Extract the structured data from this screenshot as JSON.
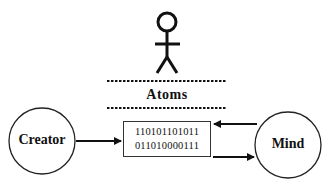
{
  "diagram": {
    "figure": {
      "icon": "stick-figure-icon"
    },
    "divider_label": "Atoms",
    "nodes": {
      "creator": {
        "label": "Creator"
      },
      "mind": {
        "label": "Mind"
      }
    },
    "binary_box": {
      "lines": [
        "110101101011",
        "011010000111"
      ]
    },
    "edges": [
      {
        "from": "Creator",
        "to": "binary_box"
      },
      {
        "from": "Mind",
        "to": "binary_box"
      },
      {
        "from": "binary_box",
        "to": "Mind"
      }
    ],
    "colors": {
      "stroke": "#111111",
      "background": "#ffffff"
    }
  }
}
